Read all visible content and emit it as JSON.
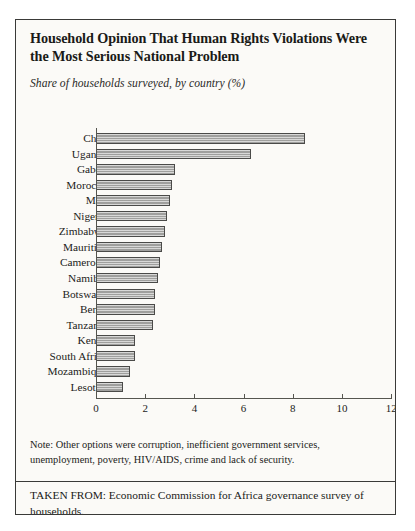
{
  "figure": {
    "title": "Household Opinion That Human Rights Violations Were the Most Serious National Problem",
    "subtitle": "Share of households surveyed, by country (%)",
    "note": "Note: Other options were corruption, inefficient government services, unemployment, poverty, HIV/AIDS, crime and lack of security.",
    "source": "TAKEN FROM: Economic Commission for Africa governance survey of households."
  },
  "chart_data": {
    "type": "bar",
    "orientation": "horizontal",
    "title": "Household Opinion That Human Rights Violations Were the Most Serious National Problem",
    "subtitle": "Share of households surveyed, by country (%)",
    "xlabel": "",
    "ylabel": "",
    "xlim": [
      0,
      12
    ],
    "xticks": [
      0,
      2,
      4,
      6,
      8,
      10,
      12
    ],
    "xtick_labels": [
      "0",
      "2",
      "4",
      "6",
      "8",
      "10",
      "12"
    ],
    "grid": false,
    "legend": false,
    "bar_color": "#a9a9a7",
    "bar_edge_color": "#4a4a48",
    "categories": [
      "Chad",
      "Uganda",
      "Gabon",
      "Morocco",
      "Mali",
      "Nigeria",
      "Zimbabwe",
      "Mauritius",
      "Cameroon",
      "Namibia",
      "Botswana",
      "Benin",
      "Tanzania",
      "Kenya",
      "South Africa",
      "Mozambique",
      "Lesotho"
    ],
    "values": [
      8.5,
      6.3,
      3.2,
      3.1,
      3.0,
      2.9,
      2.8,
      2.7,
      2.6,
      2.5,
      2.4,
      2.4,
      2.3,
      1.6,
      1.6,
      1.4,
      1.1
    ]
  }
}
